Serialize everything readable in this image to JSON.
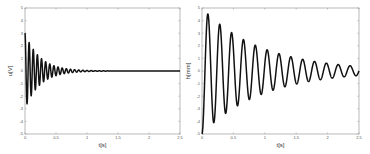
{
  "chart_data": [
    {
      "type": "line",
      "title": "",
      "xlabel": "t[s]",
      "ylabel": "u[V]",
      "xlim": [
        0,
        2.5
      ],
      "ylim": [
        -5,
        5
      ],
      "xticks": [
        0,
        0.5,
        1,
        1.5,
        2,
        2.5
      ],
      "xtick_labels": [
        "0",
        "0.5",
        "1",
        "1.5",
        "2",
        "2.5"
      ],
      "yticks": [
        -5,
        -4,
        -3,
        -2,
        -1,
        0,
        1,
        2,
        3,
        4,
        5
      ],
      "ytick_labels": [
        "-5",
        "-4",
        "-3",
        "-2",
        "-1",
        "0",
        "1",
        "2",
        "3",
        "4",
        "5"
      ],
      "grid": false,
      "series": [
        {
          "name": "u",
          "model": "damped oscillation",
          "initial_value": 3.0,
          "frequency_hz": 15.0,
          "decay_rate_per_s": 4.2,
          "final_value": 0.0,
          "key_points": [
            {
              "x": 0.0,
              "y": 3.0
            },
            {
              "x": 0.033,
              "y": -2.6
            },
            {
              "x": 0.067,
              "y": 2.2
            },
            {
              "x": 0.1,
              "y": -1.9
            },
            {
              "x": 0.133,
              "y": 1.6
            },
            {
              "x": 0.2,
              "y": 1.2
            },
            {
              "x": 0.3,
              "y": 0.8
            },
            {
              "x": 0.5,
              "y": 0.35
            },
            {
              "x": 0.8,
              "y": 0.1
            },
            {
              "x": 1.0,
              "y": 0.0
            },
            {
              "x": 2.5,
              "y": 0.0
            }
          ]
        }
      ]
    },
    {
      "type": "line",
      "title": "",
      "xlabel": "t[s]",
      "ylabel": "h[mm]",
      "xlim": [
        0,
        2.5
      ],
      "ylim": [
        -5,
        5
      ],
      "xticks": [
        0,
        0.5,
        1,
        1.5,
        2,
        2.5
      ],
      "xtick_labels": [
        "0",
        "0.5",
        "1",
        "1.5",
        "2",
        "2.5"
      ],
      "yticks": [
        -5,
        -4,
        -3,
        -2,
        -1,
        0,
        1,
        2,
        3,
        4,
        5
      ],
      "ytick_labels": [
        "-5",
        "-4",
        "-3",
        "-2",
        "-1",
        "0",
        "1",
        "2",
        "3",
        "4",
        "5"
      ],
      "grid": false,
      "series": [
        {
          "name": "h",
          "model": "damped oscillation",
          "initial_value": -5.0,
          "frequency_hz": 5.3,
          "decay_rate_per_s": 1.05,
          "final_value": 0.0,
          "key_points": [
            {
              "x": 0.0,
              "y": -5.0
            },
            {
              "x": 0.1,
              "y": 4.3
            },
            {
              "x": 0.2,
              "y": -3.5
            },
            {
              "x": 0.28,
              "y": 3.2
            },
            {
              "x": 0.38,
              "y": -3.0
            },
            {
              "x": 0.47,
              "y": 2.7
            },
            {
              "x": 0.66,
              "y": 2.1
            },
            {
              "x": 0.85,
              "y": 1.7
            },
            {
              "x": 1.04,
              "y": 1.3
            },
            {
              "x": 1.42,
              "y": 0.85
            },
            {
              "x": 1.8,
              "y": 0.55
            },
            {
              "x": 2.18,
              "y": 0.4
            },
            {
              "x": 2.5,
              "y": 0.25
            }
          ]
        }
      ]
    }
  ]
}
